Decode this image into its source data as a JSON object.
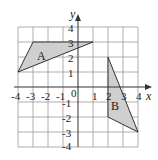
{
  "diagram": {
    "type": "coordinate-grid",
    "x_axis_label": "x",
    "y_axis_label": "y",
    "x_range": [
      -4,
      4
    ],
    "y_range": [
      -4,
      4
    ],
    "x_ticks": [
      "-4",
      "-3",
      "-2",
      "-1",
      "0",
      "1",
      "2",
      "3",
      "4"
    ],
    "y_ticks": [
      "4",
      "3",
      "2",
      "1",
      "-1",
      "-2",
      "-3",
      "-4"
    ],
    "origin_label": "0",
    "shapes": [
      {
        "label": "A",
        "vertices": [
          [
            -4,
            1
          ],
          [
            -3,
            3
          ],
          [
            1,
            3
          ]
        ],
        "fill": "#cfcfcf"
      },
      {
        "label": "B",
        "vertices": [
          [
            2,
            2
          ],
          [
            2,
            -2
          ],
          [
            4,
            -3
          ]
        ],
        "fill": "#cfcfcf"
      }
    ]
  }
}
